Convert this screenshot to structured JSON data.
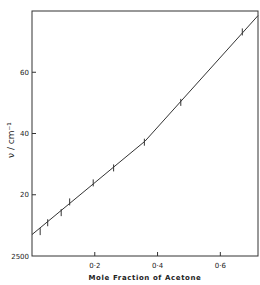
{
  "chart_data": {
    "type": "line",
    "title": "",
    "xlabel": "Mole Fraction of Acetone",
    "ylabel": "ν / cm⁻¹",
    "xlim": [
      0,
      0.72
    ],
    "ylim": [
      2500,
      2580
    ],
    "grid": false,
    "legend": null,
    "x_ticks": [
      0.2,
      0.4,
      0.6
    ],
    "x_tick_labels": [
      "0·2",
      "0·4",
      "0·6"
    ],
    "y_ticks": [
      2500,
      2520,
      2540,
      2560
    ],
    "y_tick_labels": [
      "2500",
      "20",
      "40",
      "60"
    ],
    "series": [
      {
        "name": "measured points (error bars)",
        "x": [
          0.026,
          0.05,
          0.093,
          0.12,
          0.195,
          0.26,
          0.358,
          0.474,
          0.67
        ],
        "y": [
          2507.8,
          2510.7,
          2514.0,
          2517.5,
          2523.7,
          2528.6,
          2537.0,
          2550.0,
          2573.0
        ]
      },
      {
        "name": "fit line",
        "x": [
          0.0,
          0.36,
          0.72
        ],
        "y": [
          2507.0,
          2537.5,
          2578.5
        ]
      }
    ]
  },
  "labels": {
    "x_axis_title": "Mole Fraction of Acetone",
    "y_axis_title": "ν / cm⁻¹"
  }
}
